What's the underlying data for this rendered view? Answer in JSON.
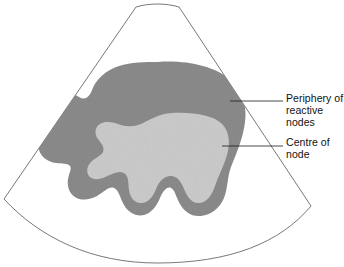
{
  "figure": {
    "kind": "ultrasound-sector-diagram",
    "background_color": "#ffffff",
    "sector": {
      "outline_color": "#4a4a4a",
      "fill_color": "#ffffff",
      "stroke_width": 0.8,
      "top_left_x": 136,
      "top_right_x": 179,
      "top_y": 7,
      "left_corner": [
        4,
        199
      ],
      "right_corner": [
        311,
        206
      ],
      "bottom_apex_y": 263
    },
    "regions": [
      {
        "id": "periphery",
        "name": "periphery-of-reactive-nodes",
        "fill_color": "#8b8b8b",
        "description": "dark grey outer rim of the node"
      },
      {
        "id": "centre",
        "name": "centre-of-node",
        "fill_color": "#cbcbcb",
        "description": "light grey hilum / centre of the node"
      }
    ],
    "annotations": [
      {
        "id": "periphery",
        "label": "Periphery of\nreactive\nnodes",
        "leader_color": "#1a1a1a",
        "leader_from": [
          230,
          101
        ],
        "leader_to": [
          283,
          101
        ],
        "text_x": 286,
        "text_y": 93
      },
      {
        "id": "centre",
        "label": "Centre of\nnode",
        "leader_color": "#1a1a1a",
        "leader_from": [
          222,
          146
        ],
        "leader_to": [
          283,
          146
        ],
        "text_x": 286,
        "text_y": 137
      }
    ]
  }
}
